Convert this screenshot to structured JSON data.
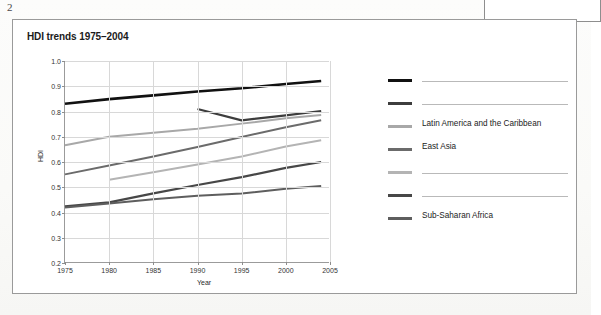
{
  "page": {
    "page_number": "2",
    "corner_box": ""
  },
  "figure": {
    "title": "HDI trends 1975–2004"
  },
  "chart_data": {
    "type": "line",
    "title": "HDI trends 1975–2004",
    "xlabel": "Year",
    "ylabel": "HDI",
    "xlim": [
      1975,
      2005
    ],
    "ylim": [
      0.2,
      1.0
    ],
    "xticks": [
      1975,
      1980,
      1985,
      1990,
      1995,
      2000,
      2005
    ],
    "yticks": [
      0.2,
      0.3,
      0.4,
      0.5,
      0.6,
      0.7,
      0.8,
      0.9,
      1.0
    ],
    "grid": true,
    "legend_position": "right",
    "series": [
      {
        "name": "",
        "label_redacted": true,
        "color": "#111111",
        "width": 2.6,
        "x": [
          1975,
          1980,
          1985,
          1990,
          1995,
          2000,
          2004
        ],
        "values": [
          0.831,
          0.849,
          0.864,
          0.879,
          0.892,
          0.909,
          0.921
        ]
      },
      {
        "name": "",
        "label_redacted": true,
        "color": "#3d3d3d",
        "width": 2.2,
        "x": [
          1990,
          1995,
          2000,
          2004
        ],
        "values": [
          0.81,
          0.765,
          0.785,
          0.802
        ]
      },
      {
        "name": "Latin America and the Caribbean",
        "label_redacted": false,
        "color": "#a8a8a8",
        "width": 2.0,
        "x": [
          1975,
          1980,
          1985,
          1990,
          1995,
          2000,
          2004
        ],
        "values": [
          0.666,
          0.7,
          0.716,
          0.732,
          0.752,
          0.773,
          0.786
        ]
      },
      {
        "name": "East Asia",
        "label_redacted": false,
        "color": "#6b6b6b",
        "width": 2.0,
        "x": [
          1975,
          1980,
          1985,
          1990,
          1995,
          2000,
          2004
        ],
        "values": [
          0.551,
          0.586,
          0.622,
          0.659,
          0.699,
          0.738,
          0.765
        ]
      },
      {
        "name": "",
        "label_redacted": true,
        "color": "#b4b4b4",
        "width": 2.0,
        "x": [
          1980,
          1985,
          1990,
          1995,
          2000,
          2004
        ],
        "values": [
          0.53,
          0.559,
          0.59,
          0.622,
          0.661,
          0.686
        ]
      },
      {
        "name": "",
        "label_redacted": true,
        "color": "#474747",
        "width": 2.2,
        "x": [
          1975,
          1980,
          1985,
          1990,
          1995,
          2000,
          2004
        ],
        "values": [
          0.424,
          0.44,
          0.476,
          0.509,
          0.54,
          0.577,
          0.6
        ]
      },
      {
        "name": "Sub-Saharan Africa",
        "label_redacted": false,
        "color": "#5e5e5e",
        "width": 2.0,
        "x": [
          1975,
          1980,
          1985,
          1990,
          1995,
          2000,
          2004
        ],
        "values": [
          0.42,
          0.436,
          0.452,
          0.466,
          0.475,
          0.494,
          0.505
        ]
      }
    ]
  }
}
